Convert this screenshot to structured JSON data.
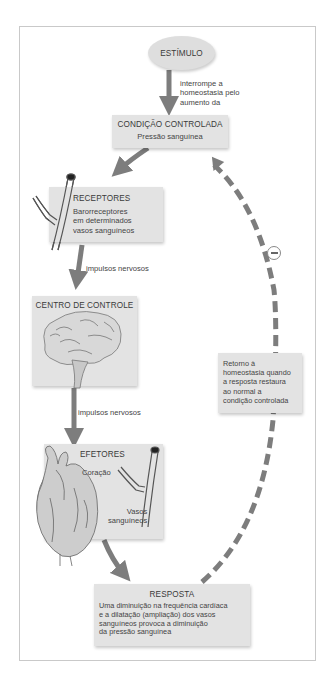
{
  "diagram": {
    "type": "homeostasis-negative-feedback-loop",
    "stimulus": {
      "label": "ESTÍMULO"
    },
    "stimulus_arrow_label": [
      "interrompe a",
      "homeostasia pelo",
      "aumento da"
    ],
    "controlled_condition": {
      "title": "CONDIÇÃO CONTROLADA",
      "subtitle": "Pressão sanguínea"
    },
    "receptors": {
      "title": "RECEPTORES",
      "lines": [
        "Barorreceptores",
        "em determinados",
        "vasos sanguíneos"
      ]
    },
    "receptors_arrow_label": "impulsos nervosos",
    "control_center": {
      "title": "CENTRO DE CONTROLE",
      "subtitle": "Encéfalo"
    },
    "control_arrow_label": "impulsos nervosos",
    "effectors": {
      "title": "EFETORES",
      "heart_label": "Coração",
      "vessels_label": [
        "Vasos",
        "sanguíneos"
      ]
    },
    "response": {
      "title": "RESPOSTA",
      "lines": [
        "Uma diminuição na frequência cardíaca",
        "e a dilatação (ampliação) dos vasos",
        "sanguíneos provoca a diminuição",
        "da pressão sanguínea"
      ]
    },
    "feedback": {
      "sign": "−",
      "lines": [
        "Retorno à",
        "homeostasia quando",
        "a resposta restaura",
        "ao normal a",
        "condição controlada"
      ]
    },
    "colors": {
      "box_fill": "#e3e3e3",
      "arrow": "#7d7d7d",
      "frame_border": "#c9c9c9"
    }
  }
}
